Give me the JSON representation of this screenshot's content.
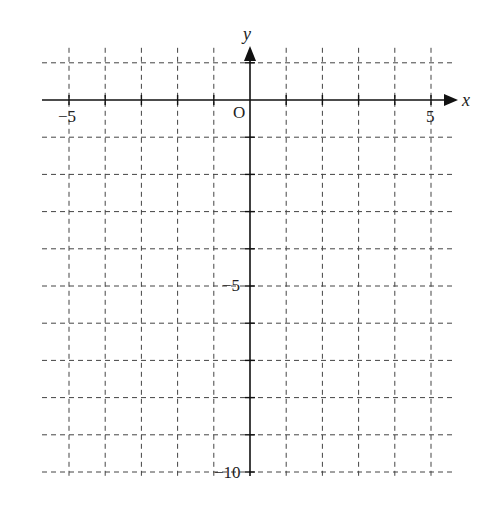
{
  "chart_data": {
    "type": "coordinate-grid",
    "title": "",
    "xlabel": "x",
    "ylabel": "y",
    "origin_label": "O",
    "x_range": [
      -5,
      5
    ],
    "y_range": [
      -10,
      1
    ],
    "grid": true,
    "grid_style": "dashed",
    "x_tick_labels": [
      {
        "value": -5,
        "label": "−5"
      },
      {
        "value": 5,
        "label": "5"
      }
    ],
    "y_tick_labels": [
      {
        "value": -5,
        "label": "−5"
      },
      {
        "value": -10,
        "label": "−10"
      }
    ],
    "series": []
  },
  "labels": {
    "x_axis": "x",
    "y_axis": "y",
    "origin": "O",
    "x_neg5": "−5",
    "x_pos5": "5",
    "y_neg5": "−5",
    "y_neg10": "−10"
  }
}
